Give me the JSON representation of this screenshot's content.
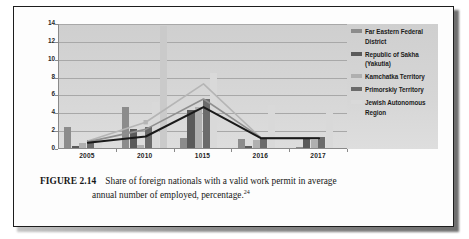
{
  "figure": {
    "label": "FIGURE 2.14",
    "caption_line1": "Share of foreign nationals with a valid work permit in average",
    "caption_line2": "annual number of employed, percentage.",
    "footnote_marker": "24"
  },
  "legend": {
    "items": [
      {
        "label_line1": "Far Eastern Federal",
        "label_line2": "District",
        "color": "#8c8c8c"
      },
      {
        "label_line1": "Republic of Sakha",
        "label_line2": "(Yakutia)",
        "color": "#5a5a5a"
      },
      {
        "label_line1": "Kamchatka Territory",
        "label_line2": "",
        "color": "#b0b0b0"
      },
      {
        "label_line1": "Primorskiy Territory",
        "label_line2": "",
        "color": "#6b6b6b"
      },
      {
        "label_line1": "Jewish Autonomous",
        "label_line2": "Region",
        "color": "#d9d9d9"
      }
    ]
  },
  "chart_data": {
    "type": "bar",
    "title": "",
    "xlabel": "",
    "ylabel": "",
    "ylim": [
      0,
      14
    ],
    "yticks": [
      0,
      2,
      4,
      6,
      8,
      10,
      12,
      14
    ],
    "ytick_labels": [
      "0",
      "2",
      "4",
      "6",
      "8",
      "10",
      "12",
      "14"
    ],
    "grid": true,
    "legend_position": "right",
    "categories": [
      "2005",
      "2010",
      "1015",
      "2016",
      "2017"
    ],
    "series": [
      {
        "name": "Far Eastern Federal District",
        "color": "#8c8c8c",
        "values": [
          2.3,
          4.6,
          1.1,
          1.0,
          0.15
        ]
      },
      {
        "name": "Republic of Sakha (Yakutia)",
        "color": "#5a5a5a",
        "values": [
          0.2,
          2.1,
          4.3,
          0.2,
          1.25
        ]
      },
      {
        "name": "Kamchatka Territory",
        "color": "#b0b0b0",
        "values": [
          0.55,
          0.35,
          4.6,
          0.9,
          0.9
        ]
      },
      {
        "name": "Primorskiy Territory",
        "color": "#6b6b6b",
        "values": [
          0.9,
          2.3,
          5.5,
          1.1,
          1.2
        ]
      },
      {
        "name": "Jewish Autonomous Region",
        "color": "#d9d9d9",
        "values": [
          0.6,
          5.2,
          8.4,
          4.8,
          3.9
        ]
      },
      {
        "name": "Far Eastern Federal District (tall)",
        "color": "#cacaca",
        "values": [
          0.0,
          13.7,
          0.0,
          0.0,
          0.0
        ]
      }
    ],
    "trend_lines": [
      {
        "name": "light-trend",
        "color": "#b5b5b5",
        "values": [
          0.9,
          3.0,
          7.3,
          1.2,
          1.2
        ]
      },
      {
        "name": "mid-trend",
        "color": "#8f8f8f",
        "values": [
          0.8,
          2.2,
          5.6,
          1.25,
          1.25
        ]
      },
      {
        "name": "dark-trend",
        "color": "#1a1a1a",
        "values": [
          0.7,
          1.4,
          4.7,
          1.2,
          1.2
        ]
      }
    ],
    "markers": [
      {
        "series": "light-trend",
        "category": "2010",
        "value": 3.0
      }
    ]
  }
}
